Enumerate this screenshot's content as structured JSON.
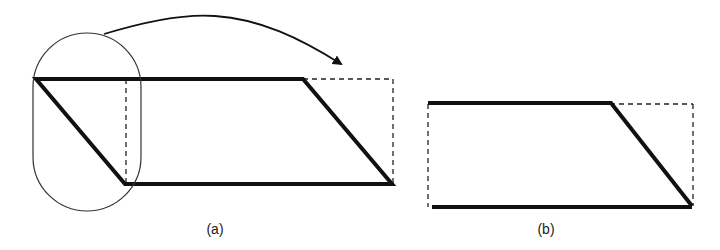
{
  "figure": {
    "panels": [
      {
        "id": "a",
        "label": "(a)",
        "shape": "parallelogram with rounded-capsule selection and curved arrow moving left triangle to the right"
      },
      {
        "id": "b",
        "label": "(b)",
        "shape": "trapezoid inside dashed rectangle"
      }
    ],
    "colors": {
      "stroke": "#111111",
      "thin_stroke": "#333333",
      "background": "#ffffff"
    }
  }
}
